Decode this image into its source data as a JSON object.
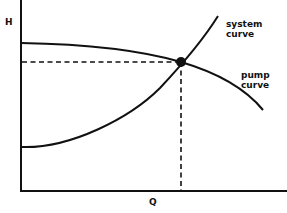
{
  "diagram": {
    "type": "pump-system-curve",
    "axes": {
      "y_label": "H",
      "x_label": "Q"
    },
    "curves": [
      {
        "name": "system",
        "label_line1": "system",
        "label_line2": "curve"
      },
      {
        "name": "pump",
        "label_line1": "pump",
        "label_line2": "curve"
      }
    ],
    "operating_point": {
      "description": "intersection of system curve and pump curve"
    },
    "colors": {
      "ink": "#111111",
      "background": "#ffffff"
    }
  }
}
